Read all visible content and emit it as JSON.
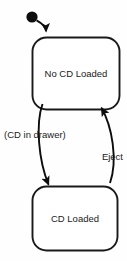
{
  "diagram": {
    "type": "state-machine",
    "background_color": "#fefefe",
    "stroke_color": "#1a1a1a",
    "fill_color": "#ffffff",
    "states": [
      {
        "id": "no-cd-loaded",
        "label": "No CD Loaded",
        "x": 32,
        "y": 37,
        "width": 88,
        "height": 73,
        "corner_radius": 14
      },
      {
        "id": "cd-loaded",
        "label": "CD Loaded",
        "x": 32,
        "y": 186,
        "width": 86,
        "height": 65,
        "corner_radius": 14
      }
    ],
    "initial_marker": {
      "id": "initial-pseudostate",
      "cx": 32,
      "cy": 17,
      "r": 5.5,
      "target_state": "no-cd-loaded"
    },
    "transitions": [
      {
        "id": "load",
        "label": "(CD in drawer)",
        "from": "no-cd-loaded",
        "to": "cd-loaded",
        "label_x": 4,
        "label_y": 135,
        "label_align": "left"
      },
      {
        "id": "eject",
        "label": "Eject",
        "from": "cd-loaded",
        "to": "no-cd-loaded",
        "label_x": 122,
        "label_y": 157,
        "label_align": "right"
      }
    ]
  }
}
